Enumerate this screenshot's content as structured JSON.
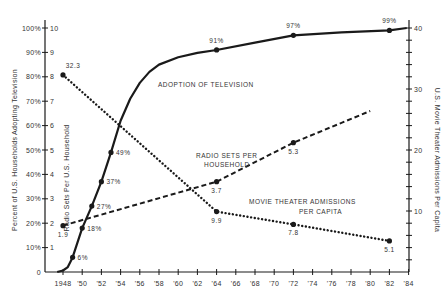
{
  "chart_data": {
    "type": "line",
    "title": "",
    "xlabel": "",
    "x_ticks": [
      "1948",
      "'50",
      "'52",
      "'54",
      "'56",
      "'58",
      "'60",
      "'62",
      "'64",
      "'66",
      "'68",
      "'70",
      "'72",
      "'74",
      "'76",
      "'78",
      "'80",
      "'82",
      "'84"
    ],
    "xlim": [
      1947.5,
      1984
    ],
    "left_axis": {
      "label": "Percent of U.S. Households Adopting Television",
      "secondary_label": "Radio Sets Per U.S. Household",
      "percent_ticks": [
        "0",
        "10%",
        "20%",
        "30%",
        "40%",
        "50%",
        "60%",
        "70%",
        "80%",
        "90%",
        "100%"
      ],
      "radio_ticks": [
        "1",
        "2",
        "3",
        "4",
        "5",
        "6",
        "7",
        "8",
        "9",
        "10"
      ],
      "ylim_percent": [
        0,
        100
      ],
      "ylim_radio": [
        0,
        10
      ]
    },
    "right_axis": {
      "label": "U.S. Movie Theater Admissions Per Capita",
      "ticks": [
        "10",
        "20",
        "30",
        "40"
      ],
      "ylim": [
        0,
        40
      ]
    },
    "series": [
      {
        "name": "Adoption of Television",
        "axis": "left_percent",
        "style": "solid",
        "x": [
          1948,
          1949,
          1950,
          1951,
          1952,
          1953,
          1964,
          1972,
          1982
        ],
        "values": [
          0,
          6,
          18,
          27,
          37,
          49,
          91,
          97,
          99
        ],
        "labels": [
          "",
          "6%",
          "18%",
          "27%",
          "37%",
          "49%",
          "91%",
          "97%",
          "99%"
        ]
      },
      {
        "name": "Radio Sets Per Household",
        "axis": "left_radio",
        "style": "dashed",
        "x": [
          1948,
          1964,
          1972,
          1980
        ],
        "values": [
          1.9,
          3.7,
          5.3,
          6.6
        ],
        "labels": [
          "1.9",
          "3.7",
          "5.3",
          ""
        ]
      },
      {
        "name": "Movie Theater Admissions Per Capita",
        "axis": "right",
        "style": "dotted",
        "x": [
          1948,
          1964,
          1972,
          1982
        ],
        "values": [
          32.3,
          9.9,
          7.8,
          5.1
        ],
        "labels": [
          "32.3",
          "9.9",
          "7.8",
          "5.1"
        ]
      }
    ],
    "annotations": [
      {
        "text": "ADOPTION OF TELEVISION"
      },
      {
        "text": "RADIO SETS PER"
      },
      {
        "text": "HOUSEHOLD"
      },
      {
        "text": "MOVIE THEATER ADMISSIONS"
      },
      {
        "text": "PER CAPITA"
      }
    ],
    "grid": false,
    "legend": "inline annotations"
  }
}
